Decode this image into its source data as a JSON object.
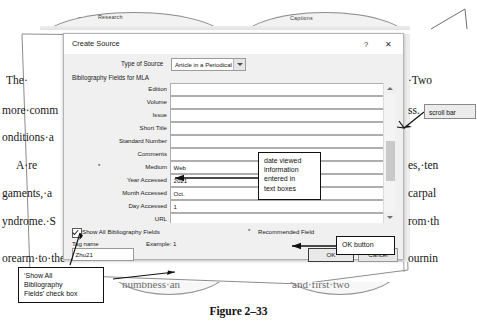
{
  "ribbon": {
    "groups": [
      "Research",
      "Captions"
    ],
    "small_hint": "••"
  },
  "document": {
    "left_fragments": [
      "The·",
      "more·comm",
      "onditions·a",
      "A·re",
      "gaments,·a",
      "yndrome.·S",
      "orearm·to·the"
    ],
    "right_fragments": [
      "·Two",
      "ss.",
      "es,·ten",
      "carpal",
      "rom·th",
      "ournin"
    ],
    "bottom_fragments": [
      "numbness·an",
      "and·first·two"
    ],
    "figure_caption": "Figure 2–33"
  },
  "dialog": {
    "title": "Create Source",
    "help_icon": "?",
    "close_icon": "✕",
    "source_type_label": "Type of Source",
    "source_type_value": "Article in a Periodical",
    "bibliography_header": "Bibliography Fields for MLA",
    "fields": [
      {
        "label": "Edition",
        "value": "",
        "recommended": false
      },
      {
        "label": "Volume",
        "value": "",
        "recommended": false
      },
      {
        "label": "Issue",
        "value": "",
        "recommended": false
      },
      {
        "label": "Short Title",
        "value": "",
        "recommended": false
      },
      {
        "label": "Standard Number",
        "value": "",
        "recommended": false
      },
      {
        "label": "Comments",
        "value": "",
        "recommended": false
      },
      {
        "label": "Medium",
        "value": "Web",
        "recommended": true
      },
      {
        "label": "Year Accessed",
        "value": "2021",
        "recommended": false
      },
      {
        "label": "Month Accessed",
        "value": "Oct.",
        "recommended": false
      },
      {
        "label": "Day Accessed",
        "value": "1",
        "recommended": false
      },
      {
        "label": "URL",
        "value": "",
        "recommended": false
      },
      {
        "label": "DOI",
        "value": "",
        "recommended": false
      }
    ],
    "show_all_label": "Show All Bibliography Fields",
    "show_all_checked": true,
    "recommended_star": "*",
    "recommended_label": "Recommended Field",
    "tag_name_label": "Tag name",
    "tag_name_value": "Zhu21",
    "example_label": "Example: 1",
    "ok_label": "OK",
    "cancel_label": "Cancel"
  },
  "annotations": {
    "scroll_bar": "scroll bar",
    "date_viewed": "date viewed\ninformation\nentered in\ntext boxes",
    "ok_button": "OK button",
    "show_all_checkbox": "‘Show All\nBibliography\nFields’ check box"
  },
  "colors": {
    "dialog_face": "#f0f0f0",
    "dialog_border": "#b4b4b4",
    "input_bg": "#ffffff",
    "callout_border": "#111111",
    "scroll_thumb": "#c9c9c9"
  }
}
